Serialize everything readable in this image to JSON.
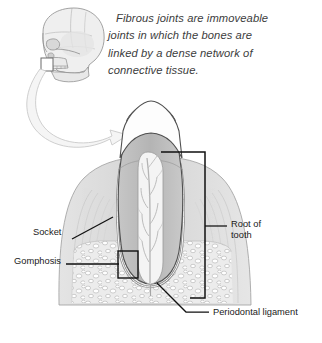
{
  "figure": {
    "caption": {
      "line1": "Fibrous joints are immoveable",
      "line2": "joints in which the bones are",
      "line3": "linked by a dense network of",
      "line4": "connective tissue."
    },
    "labels": {
      "socket": "Socket",
      "gomphosis": "Gomphosis",
      "root_of_tooth_line1": "Root of",
      "root_of_tooth_line2": "tooth",
      "periodontal_ligament": "Periodontal ligament"
    },
    "icons": {
      "skull": "skull-lateral-view-icon",
      "arrow": "curved-zoom-arrow-icon",
      "tooth": "tooth-cross-section-icon"
    },
    "colors": {
      "background": "#ffffff",
      "caption_text": "#3c3c3c",
      "label_text": "#1a1a1a",
      "leader_line": "#111111",
      "outline": "#5a5a5a",
      "enamel": "#fdfdfd",
      "dentin": "#b9b9b9",
      "pulp": "#f2f2f2",
      "gum_tissue": "#dedede",
      "cortical_bone": "#d2d2d2",
      "cancellous_bone": "#e8e8e8",
      "bone_speckle": "#a8a8a8",
      "skull_fill": "#ededed",
      "skull_line": "#8f8f8f",
      "arrow_fill": "#f4f4f4",
      "arrow_line": "#c9c9c9"
    }
  }
}
